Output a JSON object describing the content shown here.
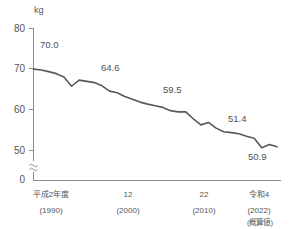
{
  "chart_data": {
    "type": "line",
    "title": "",
    "subtitle": "",
    "xlabel": "",
    "ylabel": "kg",
    "unit": "kg",
    "grid": false,
    "legend": null,
    "axis_break": true,
    "axis_break_symbol": "≈",
    "xlim": [
      1990,
      2022
    ],
    "ylim": [
      50,
      80
    ],
    "y_display_zero": "0",
    "yticks": [
      "80",
      "70",
      "60",
      "50",
      "0"
    ],
    "ytick_values": [
      80,
      70,
      60,
      50,
      0
    ],
    "xticks": [
      {
        "main": "平成2年度",
        "sub": "(1990)",
        "value": 1990
      },
      {
        "main": "12",
        "sub": "(2000)",
        "value": 2000
      },
      {
        "main": "22",
        "sub": "(2010)",
        "value": 2010
      },
      {
        "main": "令和4",
        "sub": "(2022)",
        "value": 2022
      }
    ],
    "x": [
      1990,
      1991,
      1992,
      1993,
      1994,
      1995,
      1996,
      1997,
      1998,
      1999,
      2000,
      2001,
      2002,
      2003,
      2004,
      2005,
      2006,
      2007,
      2008,
      2009,
      2010,
      2011,
      2012,
      2013,
      2014,
      2015,
      2016,
      2017,
      2018,
      2019,
      2020,
      2021,
      2022
    ],
    "values": [
      70.0,
      69.8,
      69.4,
      68.9,
      68.1,
      65.8,
      67.3,
      67.0,
      66.7,
      65.9,
      64.6,
      64.2,
      63.3,
      62.6,
      61.9,
      61.4,
      61.0,
      60.6,
      59.8,
      59.5,
      59.5,
      57.8,
      56.3,
      56.9,
      55.5,
      54.6,
      54.4,
      54.1,
      53.5,
      53.0,
      50.7,
      51.5,
      50.9
    ],
    "data_labels": [
      {
        "text": "70.0",
        "x": 1990,
        "y": 70.0,
        "position": "above"
      },
      {
        "text": "64.6",
        "x": 2000,
        "y": 64.6,
        "position": "above"
      },
      {
        "text": "59.5",
        "x": 2010,
        "y": 59.5,
        "position": "above"
      },
      {
        "text": "51.4",
        "x": 2020,
        "y": 51.4,
        "position": "above"
      },
      {
        "text": "50.9",
        "x": 2022,
        "y": 50.9,
        "position": "below"
      }
    ],
    "line_color": "#595959",
    "axis_color": "#8c8c8c",
    "text_color": "#555555",
    "background_color": "#ffffff"
  },
  "footnote": {
    "note": "(概算値)"
  }
}
